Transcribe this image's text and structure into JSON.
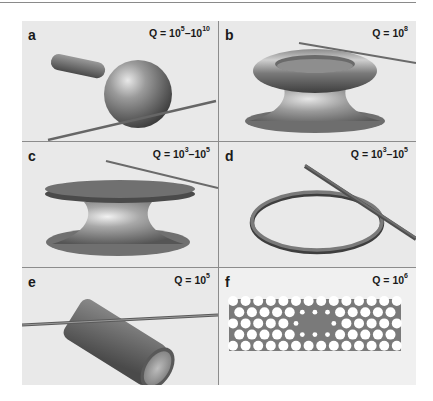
{
  "figure": {
    "panels": [
      {
        "id": "a",
        "letter": "a",
        "q_base": "Q = 10",
        "q_exp1": "5",
        "q_sep": "–10",
        "q_exp2": "10",
        "structure": "microsphere coupled to tapered fiber"
      },
      {
        "id": "b",
        "letter": "b",
        "q_base": "Q = 10",
        "q_exp1": "8",
        "q_sep": "",
        "q_exp2": "",
        "structure": "microtoroid on silicon pillar coupled to tapered fiber"
      },
      {
        "id": "c",
        "letter": "c",
        "q_base": "Q = 10",
        "q_exp1": "3",
        "q_sep": "–10",
        "q_exp2": "5",
        "structure": "microdisk on pedestal coupled to tapered fiber"
      },
      {
        "id": "d",
        "letter": "d",
        "q_base": "Q = 10",
        "q_exp1": "3",
        "q_sep": "–10",
        "q_exp2": "5",
        "structure": "microring coupled to waveguide"
      },
      {
        "id": "e",
        "letter": "e",
        "q_base": "Q = 10",
        "q_exp1": "5",
        "q_sep": "",
        "q_exp2": "",
        "structure": "capillary / hollow cylinder coupled to fiber"
      },
      {
        "id": "f",
        "letter": "f",
        "q_base": "Q = 10",
        "q_exp1": "6",
        "q_sep": "",
        "q_exp2": "",
        "structure": "photonic crystal cavity (hole lattice with defect)"
      }
    ],
    "colors": {
      "panel_bg": "#e9e9e9",
      "divider": "#8c8c8c",
      "object_gray": "#6e6e6e",
      "fiber": "#6a6a6a",
      "pc_slab": "#7a7a7a",
      "pc_hole": "#ffffff"
    }
  }
}
